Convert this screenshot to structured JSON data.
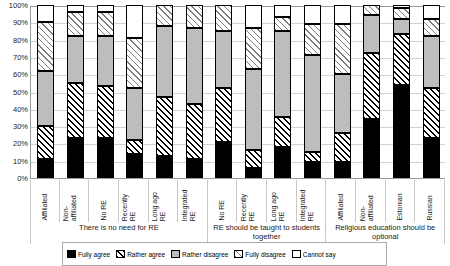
{
  "chart_data": {
    "type": "bar",
    "title": "",
    "xlabel": "",
    "ylabel": "",
    "ylim": [
      0,
      100
    ],
    "stacked": true,
    "stacked_percent": true,
    "grid": true,
    "legend_position": "bottom",
    "y_ticks": [
      "100%",
      "90%",
      "80%",
      "70%",
      "60%",
      "50%",
      "40%",
      "30%",
      "20%",
      "10%",
      "0%"
    ],
    "y_tick_values": [
      100,
      90,
      80,
      70,
      60,
      50,
      40,
      30,
      20,
      10,
      0
    ],
    "series": [
      {
        "name": "Fully agree",
        "pattern": "solid-black",
        "color": "#000000",
        "values": [
          11,
          23,
          23,
          14,
          13,
          11,
          21,
          6,
          18,
          9,
          9,
          34,
          54,
          23
        ]
      },
      {
        "name": "Rather agree",
        "pattern": "dark-diagonal-hatch",
        "color": "#ffffff",
        "values": [
          19,
          32,
          30,
          8,
          34,
          32,
          31,
          10,
          17,
          6,
          17,
          38,
          29,
          29
        ]
      },
      {
        "name": "Rather disagree",
        "pattern": "solid-grey",
        "color": "#bdbdbd",
        "values": [
          32,
          27,
          29,
          30,
          41,
          44,
          33,
          47,
          50,
          56,
          34,
          22,
          9,
          30
        ]
      },
      {
        "name": "Fully disagree",
        "pattern": "light-diagonal-hatch",
        "color": "#ffffff",
        "values": [
          28,
          14,
          14,
          29,
          12,
          13,
          15,
          24,
          8,
          18,
          29,
          6,
          6,
          10
        ]
      },
      {
        "name": "Cannot say",
        "pattern": "white",
        "color": "#ffffff",
        "values": [
          10,
          4,
          4,
          19,
          0,
          0,
          0,
          13,
          7,
          11,
          11,
          0,
          2,
          8
        ]
      }
    ],
    "categories": [
      "Affiliated",
      "Non-affiliated",
      "No RE",
      "Recently RE",
      "Long ago RE",
      "Integrated RE",
      "No RE",
      "Recently RE",
      "Long ago RE",
      "Integrated RE",
      "Affiliated",
      "Non-affiliated",
      "Estonian",
      "Russian"
    ],
    "category_label_lines": [
      [
        "Affiliated"
      ],
      [
        "Non-",
        "affiliated"
      ],
      [
        "No RE"
      ],
      [
        "Recently",
        "RE"
      ],
      [
        "Long ago",
        "RE"
      ],
      [
        "Integrated",
        "RE"
      ],
      [
        "No RE"
      ],
      [
        "Recently",
        "RE"
      ],
      [
        "Long ago",
        "RE"
      ],
      [
        "Integrated",
        "RE"
      ],
      [
        "Affiliated"
      ],
      [
        "Non-",
        "affiliated"
      ],
      [
        "Estonian"
      ],
      [
        "Russian"
      ]
    ],
    "groups": [
      {
        "label": "There is no need for RE",
        "count": 6
      },
      {
        "label": "RE should be taught to students together",
        "count": 4
      },
      {
        "label": "Religious education should be optional",
        "count": 4
      }
    ],
    "legend_entries": [
      "Fully agree",
      "Rather agree",
      "Rather disagree",
      "Fully disagree",
      "Cannot say"
    ]
  },
  "colors": {
    "black": "#000000",
    "grey": "#bdbdbd",
    "white": "#ffffff",
    "gridline": "#d2d2d2",
    "axis": "#9a9a9a"
  }
}
